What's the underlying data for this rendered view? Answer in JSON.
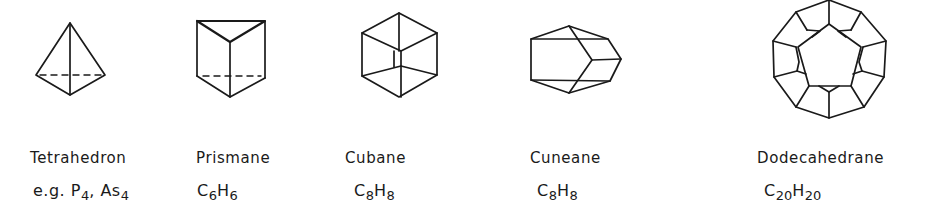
{
  "figure": {
    "molecules": [
      {
        "id": "tetrahedron",
        "name": "Tetrahedron",
        "formula_prefix": "e.g. ",
        "formula_parts": [
          {
            "el": "P",
            "n": "4"
          },
          {
            "sep": ", "
          },
          {
            "el": "As",
            "n": "4"
          }
        ]
      },
      {
        "id": "prismane",
        "name": "Prismane",
        "formula_parts": [
          {
            "el": "C",
            "n": "6"
          },
          {
            "el": "H",
            "n": "6"
          }
        ]
      },
      {
        "id": "cubane",
        "name": "Cubane",
        "formula_parts": [
          {
            "el": "C",
            "n": "8"
          },
          {
            "el": "H",
            "n": "8"
          }
        ]
      },
      {
        "id": "cuneane",
        "name": "Cuneane",
        "formula_parts": [
          {
            "el": "C",
            "n": "8"
          },
          {
            "el": "H",
            "n": "8"
          }
        ]
      },
      {
        "id": "dodecahedrane",
        "name": "Dodecahedrane",
        "formula_parts": [
          {
            "el": "C",
            "n": "20"
          },
          {
            "el": "H",
            "n": "20"
          }
        ]
      }
    ]
  },
  "labels": {
    "tetrahedron": "Tetrahedron",
    "prismane": "Prismane",
    "cubane": "Cubane",
    "cuneane": "Cuneane",
    "dodecahedrane": "Dodecahedrane"
  },
  "formulas": {
    "tetrahedron": {
      "prefix": "e.g. ",
      "a": "P",
      "a_n": "4",
      "sep": ", ",
      "b": "As",
      "b_n": "4"
    },
    "prismane": {
      "a": "C",
      "a_n": "6",
      "b": "H",
      "b_n": "6"
    },
    "cubane": {
      "a": "C",
      "a_n": "8",
      "b": "H",
      "b_n": "8"
    },
    "cuneane": {
      "a": "C",
      "a_n": "8",
      "b": "H",
      "b_n": "8"
    },
    "dodecahedrane": {
      "a": "C",
      "a_n": "20",
      "b": "H",
      "b_n": "20"
    }
  },
  "colors": {
    "ink": "#1a1a1a",
    "background": "#ffffff"
  }
}
